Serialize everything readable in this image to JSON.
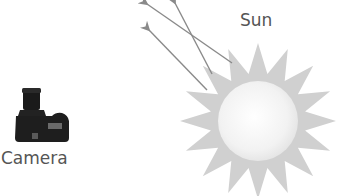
{
  "diagram": {
    "labels": {
      "sun": "Sun",
      "camera": "Camera"
    },
    "icons": {
      "camera": "dslr-camera-icon",
      "sun": "sun-icon"
    },
    "arrows": {
      "count": 3,
      "direction": "away from sun, toward upper-left"
    },
    "sun": {
      "ray_count": 16
    },
    "colors": {
      "text": "#555555",
      "arrow": "#8a8a8a",
      "sun_rays": "#cfcfcf",
      "sun_core": "#f4f4f4",
      "camera_body": "#1e1e1e"
    }
  }
}
